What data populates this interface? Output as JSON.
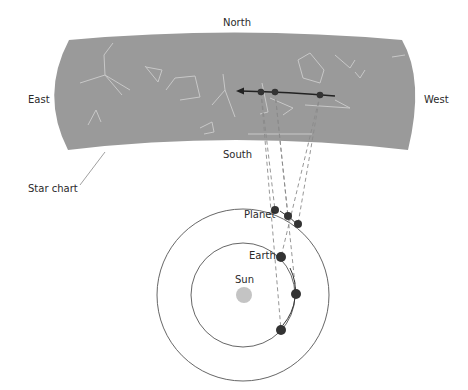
{
  "labels": {
    "north": "North",
    "south": "South",
    "east": "East",
    "west": "West",
    "star_chart": "Star chart",
    "planet": "Planet",
    "earth": "Earth",
    "sun": "Sun"
  },
  "colors": {
    "sky_band": "#9a9a9a",
    "constellation": "#c8c8c8",
    "dot": "#333333",
    "orbit": "#555555",
    "sun": "#c4c4c4",
    "sight_line": "#8a8a8a"
  },
  "sky_points": [
    {
      "x": 261,
      "y": 92
    },
    {
      "x": 275,
      "y": 92
    },
    {
      "x": 320,
      "y": 95
    }
  ],
  "earth_positions": [
    {
      "x": 281,
      "y": 257
    },
    {
      "x": 296,
      "y": 294
    },
    {
      "x": 281,
      "y": 330
    }
  ],
  "planet_positions": [
    {
      "x": 275,
      "y": 210
    },
    {
      "x": 288,
      "y": 216
    },
    {
      "x": 298,
      "y": 224
    }
  ]
}
